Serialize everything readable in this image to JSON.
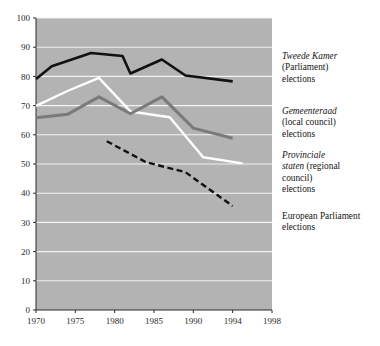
{
  "chart_data": {
    "type": "line",
    "title": "",
    "xlabel": "",
    "ylabel": "",
    "xlim": [
      1970,
      1998
    ],
    "ylim": [
      0,
      100
    ],
    "grid": true,
    "grid_axis": "y",
    "legend_position": "right",
    "plot_background": "#b3b3b3",
    "gridline_color": "#f2f2f2",
    "yticks": [
      0,
      10,
      20,
      30,
      40,
      50,
      60,
      70,
      80,
      90,
      100
    ],
    "ytick_labels": [
      "0",
      "10",
      "20",
      "30",
      "40",
      "50",
      "60",
      "70",
      "80",
      "90",
      "100"
    ],
    "xticks": [
      1970,
      1975,
      1980,
      1985,
      1990,
      1994,
      1998
    ],
    "xtick_labels": [
      "1970",
      "1975",
      "1980",
      "1985",
      "1990",
      "1994",
      "1998"
    ],
    "series": [
      {
        "name": "Tweede Kamer (Parliament) elections",
        "color": "#111111",
        "style": "solid",
        "width": 2.6,
        "x": [
          1970,
          1972,
          1977,
          1981,
          1982,
          1986,
          1989,
          1994
        ],
        "values": [
          79.1,
          83.5,
          88.0,
          87.0,
          81.0,
          85.8,
          80.3,
          78.3
        ]
      },
      {
        "name": "Provinciale staten (regional council) elections",
        "color": "#ffffff",
        "style": "solid",
        "width": 2.4,
        "x": [
          1970,
          1974,
          1978,
          1982,
          1987,
          1991,
          1995
        ],
        "values": [
          69.9,
          75.0,
          79.5,
          68.0,
          66.0,
          52.3,
          50.2
        ]
      },
      {
        "name": "Gemeenteraad (local council) elections",
        "color": "#7a7a7a",
        "style": "solid",
        "width": 3.0,
        "x": [
          1970,
          1974,
          1978,
          1982,
          1986,
          1990,
          1994
        ],
        "values": [
          65.8,
          67.0,
          73.0,
          67.2,
          73.0,
          62.3,
          58.8
        ]
      },
      {
        "name": "European Parliament elections",
        "color": "#111111",
        "style": "dashed",
        "width": 2.4,
        "x": [
          1979,
          1984,
          1989,
          1994
        ],
        "values": [
          57.8,
          50.6,
          47.2,
          35.6
        ]
      }
    ]
  },
  "legend": {
    "entries": [
      {
        "name": "tweede-kamer",
        "italic": "Tweede Kamer",
        "lines": [
          "(Parliament)",
          "elections"
        ]
      },
      {
        "name": "gemeenteraad",
        "italic": "Gemeenteraad",
        "lines": [
          "(local council)",
          " elections"
        ]
      },
      {
        "name": "provinciale",
        "italic": "Provinciale",
        "italic2": "staten",
        "lines": [
          " (regional",
          "council)",
          "elections"
        ]
      },
      {
        "name": "european",
        "italic": "",
        "lines": [
          "European Parliament",
          "elections"
        ]
      }
    ],
    "tweede_kamer": {
      "italic": "Tweede Kamer",
      "line2": "(Parliament)",
      "line3": "elections"
    },
    "gemeenteraad": {
      "italic": "Gemeenteraad",
      "line2": "(local council)",
      "line3": " elections"
    },
    "provinciale": {
      "italic": "Provinciale",
      "italic2": "staten",
      "rest2": " (regional",
      "line3": "council)",
      "line4": "elections"
    },
    "european": {
      "line1": "European Parliament",
      "line2": "elections"
    }
  }
}
